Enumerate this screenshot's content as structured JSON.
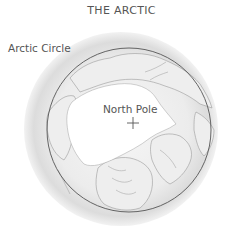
{
  "title": "THE ARCTIC",
  "labels": {
    "arctic_circle": "Arctic Circle",
    "north_pole": "North Pole"
  },
  "markers": {
    "north_pole_marker": "plus-sign"
  },
  "colors": {
    "globe_edge": "#d8d8d8",
    "globe_center": "#f4f4f4",
    "ice": "#ffffff",
    "coastline": "#8a8a8a",
    "arctic_circle_line": "#555555",
    "text": "#555555"
  }
}
